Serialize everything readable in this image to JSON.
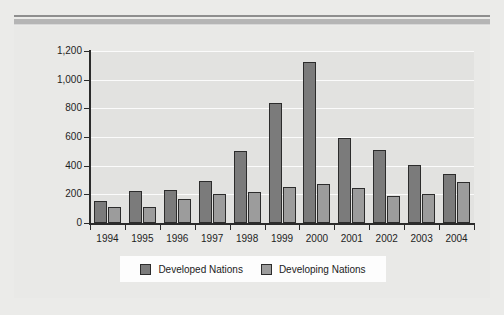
{
  "figure": {
    "background_color": "#ebebe9",
    "plot_background_color": "#e2e2e0",
    "gridline_color": "#ffffff",
    "axis_color": "#2b2b2b"
  },
  "legend": {
    "position": "bottom-center",
    "entries": [
      {
        "label": "Developed Nations",
        "color": "#7b7b7b",
        "swatch_name": "legend-swatch-developed"
      },
      {
        "label": "Developing Nations",
        "color": "#9c9c9c",
        "swatch_name": "legend-swatch-developing"
      }
    ]
  },
  "chart_data": {
    "type": "bar",
    "title": "",
    "subtitle": "",
    "xlabel": "",
    "ylabel": "",
    "grid": true,
    "legend_position": "bottom-center",
    "categories": [
      "1994",
      "1995",
      "1996",
      "1997",
      "1998",
      "1999",
      "2000",
      "2001",
      "2002",
      "2003",
      "2004"
    ],
    "ylim": [
      0,
      1200
    ],
    "yticks": [
      0,
      200,
      400,
      600,
      800,
      1000,
      1200
    ],
    "ytick_labels": [
      "0",
      "200",
      "400",
      "600",
      "800",
      "1,000",
      "1,200"
    ],
    "series": [
      {
        "name": "Developed Nations",
        "color": "#7b7b7b",
        "values": [
          155,
          220,
          230,
          290,
          500,
          840,
          1120,
          595,
          510,
          405,
          345
        ]
      },
      {
        "name": "Developing Nations",
        "color": "#9c9c9c",
        "values": [
          115,
          115,
          165,
          200,
          215,
          250,
          275,
          245,
          190,
          205,
          285
        ]
      }
    ]
  }
}
